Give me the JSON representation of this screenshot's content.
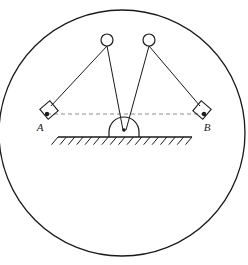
{
  "figure": {
    "background_color": "#ffffff",
    "stroke_color": "#1a1a1a",
    "dash_color": "#8c8c8c"
  },
  "boundary_circle": {
    "name": "outer-boundary-circle",
    "cx": 122,
    "cy": 133,
    "r": 123,
    "stroke_width": 1.3
  },
  "balls": [
    {
      "id": "ball-left",
      "label": "",
      "cx": 107,
      "cy": 40,
      "r": 6
    },
    {
      "id": "ball-right",
      "label": "",
      "cx": 149,
      "cy": 40,
      "r": 6
    }
  ],
  "pivot": {
    "name": "dome-pivot",
    "cx": 124,
    "cy": 137,
    "r": 15,
    "dot_cx": 124,
    "dot_cy": 130,
    "dot_r": 1.8
  },
  "blocks": [
    {
      "id": "block-a",
      "label": "A",
      "label_x": 40,
      "label_y": 131,
      "dot_cx": 47,
      "dot_cy": 114,
      "dot_r": 2.2,
      "angle_deg": -40,
      "cx": 49,
      "cy": 110,
      "size": 13
    },
    {
      "id": "block-b",
      "label": "B",
      "label_x": 207,
      "label_y": 131,
      "dot_cx": 204,
      "dot_cy": 114,
      "dot_r": 2.2,
      "angle_deg": 40,
      "cx": 202,
      "cy": 110,
      "size": 13
    }
  ],
  "dashed_line": {
    "name": "horizontal-reference-line",
    "x1": 47,
    "y1": 114,
    "x2": 204,
    "y2": 114,
    "dash": "4 3"
  },
  "ground": {
    "name": "ground-line",
    "x1": 58,
    "y1": 137,
    "x2": 192,
    "y2": 137,
    "hatch_count": 16,
    "hatch_length": 10,
    "hatch_angle_deg": 50
  },
  "strings": [
    {
      "id": "string-left-to-block-a",
      "x1": 107,
      "y1": 46,
      "x2": 51,
      "y2": 106
    },
    {
      "id": "string-left-to-pivot",
      "x1": 107,
      "y1": 46,
      "x2": 123,
      "y2": 130
    },
    {
      "id": "string-right-to-pivot",
      "x1": 149,
      "y1": 46,
      "x2": 126,
      "y2": 130
    },
    {
      "id": "string-right-to-block-b",
      "x1": 149,
      "y1": 46,
      "x2": 200,
      "y2": 106
    }
  ]
}
